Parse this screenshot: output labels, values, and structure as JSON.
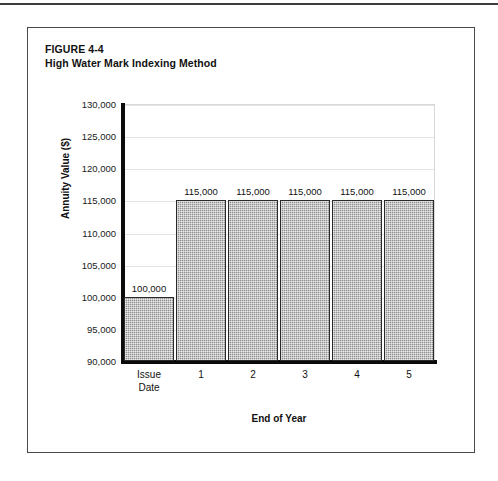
{
  "page": {
    "top_rule": true
  },
  "figure": {
    "label": "FIGURE 4-4",
    "title": "High Water Mark Indexing Method"
  },
  "chart_data": {
    "type": "bar",
    "title": "High Water Mark Indexing Method",
    "figure_number": "FIGURE 4-4",
    "categories": [
      "Issue Date",
      "1",
      "2",
      "3",
      "4",
      "5"
    ],
    "category_lines": [
      [
        "Issue",
        "Date"
      ],
      [
        "1"
      ],
      [
        "2"
      ],
      [
        "3"
      ],
      [
        "4"
      ],
      [
        "5"
      ]
    ],
    "values": [
      100000,
      115000,
      115000,
      115000,
      115000,
      115000
    ],
    "data_labels": [
      "100,000",
      "115,000",
      "115,000",
      "115,000",
      "115,000",
      "115,000"
    ],
    "xlabel": "End of Year",
    "ylabel": "Annuity Value ($)",
    "ylim": [
      90000,
      130000
    ],
    "ytick_values": [
      130000,
      125000,
      120000,
      115000,
      110000,
      105000,
      100000,
      95000,
      90000
    ],
    "ytick_labels": [
      "130,000",
      "125,000",
      "120,000",
      "115,000",
      "110,000",
      "105,000",
      "100,000",
      "95,000",
      "90,000"
    ],
    "grid": true,
    "grid_axis": "y",
    "legend": false,
    "bar_fill_color": "#8e8e8e",
    "bar_edge_color": "#2a2a2a",
    "grid_color": "#e4e4e4",
    "axis_color": "#0b0b0b"
  }
}
